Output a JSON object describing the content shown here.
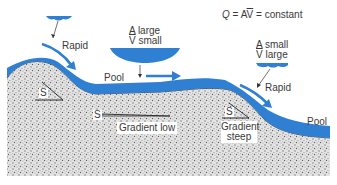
{
  "diagram": {
    "formula": {
      "q": "Q",
      "eq1": " = A",
      "v": "V",
      "eq2": " = constant"
    },
    "labels": {
      "rapid_left": "Rapid",
      "a_large_line1": "A large",
      "a_large_v": "V",
      "a_large_line2_rest": " small",
      "pool_middle": "Pool",
      "a_small_line1": "A small",
      "a_small_v": "V",
      "a_small_line2_rest": " large",
      "rapid_right": "Rapid",
      "pool_right": "Pool",
      "slope_left": "S",
      "slope_middle": "S",
      "gradient_low": "Gradient low",
      "slope_right": "S",
      "gradient_steep_line1": "Gradient",
      "gradient_steep_line2": "steep"
    },
    "colors": {
      "water": "#2f7fd3",
      "ground": "#c9c9c9",
      "text": "#3a3a3a",
      "background": "#ffffff"
    }
  }
}
